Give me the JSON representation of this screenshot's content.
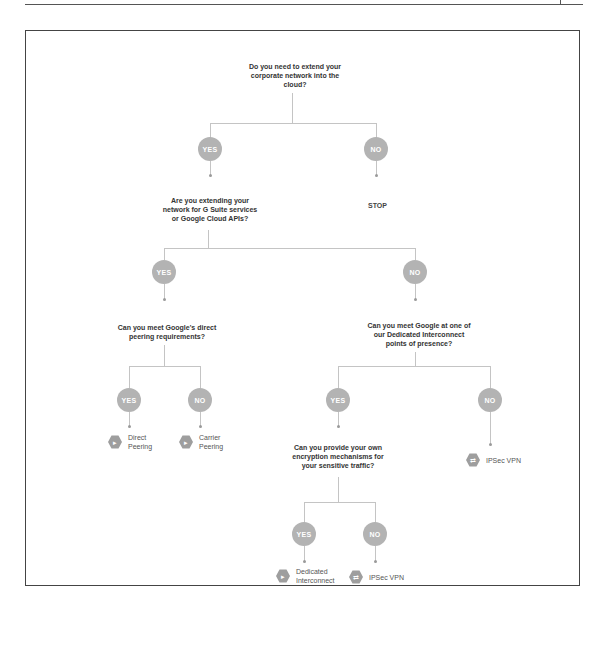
{
  "diagram": {
    "colors": {
      "node": "#b3b3b3",
      "line": "#c4c4c4",
      "text": "#333333",
      "frame": "#444444"
    },
    "questions": {
      "q1": "Do you need to extend your corporate network into the cloud?",
      "q2": "Are you extending your network for G Suite services or Google Cloud APIs?",
      "q3": "Can you meet Google's direct peering requirements?",
      "q4": "Can you meet Google at one of our Dedicated Interconnect points of presence?",
      "q5": "Can you provide your own encryption mechanisms for your sensitive traffic?"
    },
    "answers": {
      "yes": "YES",
      "no": "NO"
    },
    "terminal": {
      "stop": "STOP"
    },
    "outcomes": {
      "direct_peering": {
        "label": "Direct Peering",
        "icon": "peering-icon"
      },
      "carrier_peering": {
        "label": "Carrier Peering",
        "icon": "peering-icon"
      },
      "ipsec_vpn_1": {
        "label": "IPSec VPN",
        "icon": "vpn-icon"
      },
      "dedicated_interconnect": {
        "label": "Dedicated Interconnect",
        "icon": "interconnect-icon"
      },
      "ipsec_vpn_2": {
        "label": "IPSec VPN",
        "icon": "vpn-icon"
      }
    }
  }
}
